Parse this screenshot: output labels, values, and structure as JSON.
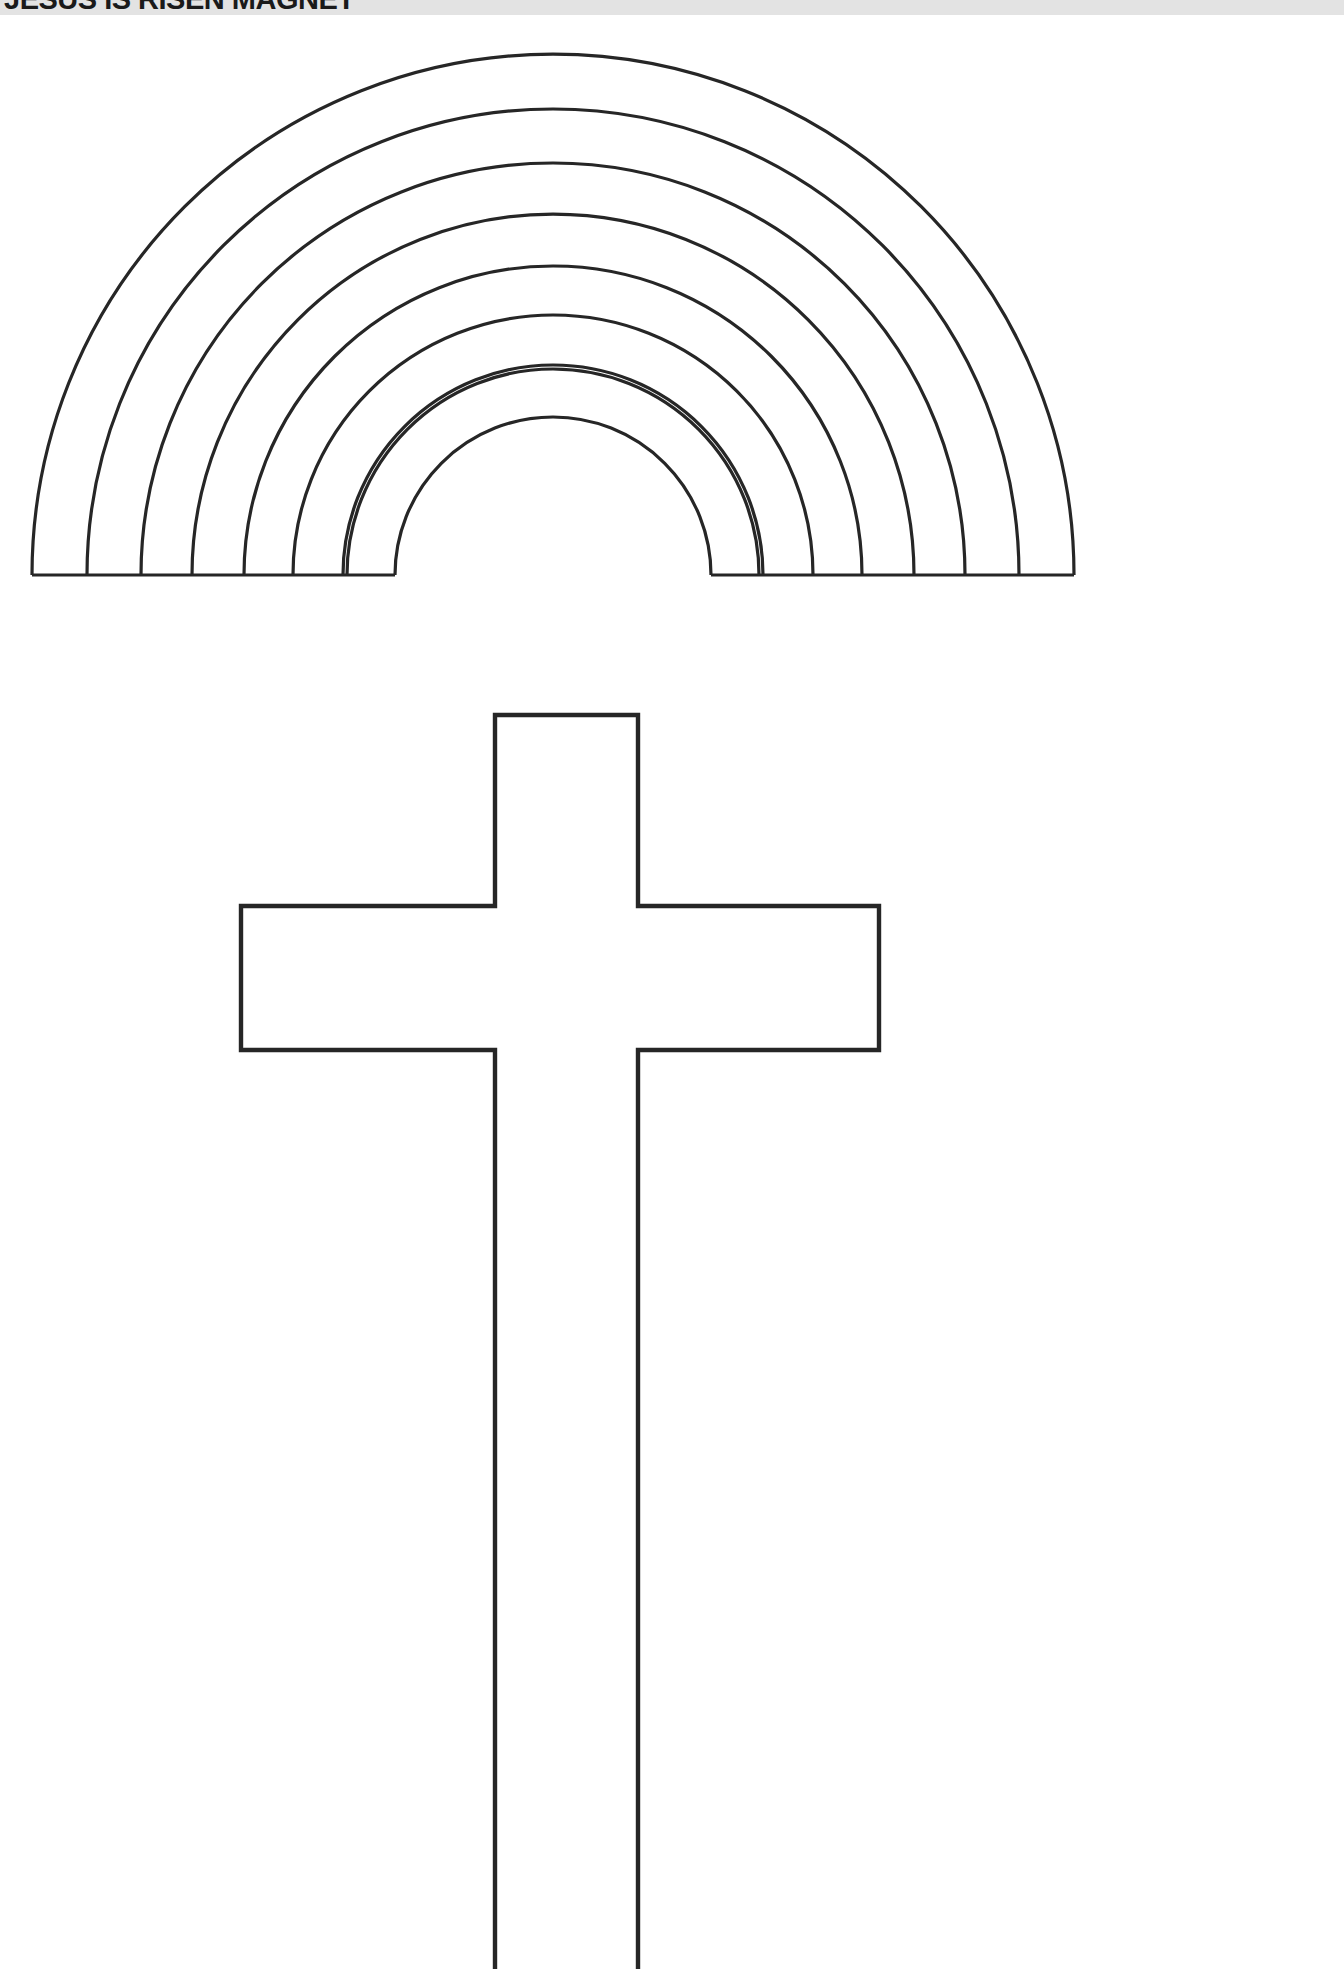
{
  "header": {
    "title": "JESUS IS RISEN MAGNET",
    "band_color": "#e3e3e3",
    "text_color": "#1a1a1a",
    "clipped": "true"
  },
  "page": {
    "background_color": "#ffffff",
    "ink_color": "#262626",
    "width": 1344,
    "height": 1969,
    "kind": "printable-craft-template",
    "shape_count": 2
  },
  "artwork": {
    "rainbow": {
      "name": "rainbow-outline",
      "description": "Nine concentric semicircular arch bands drawn as open outlines sitting on a horizontal baseline",
      "band_count": 9,
      "center_x": 553,
      "baseline_y": 575,
      "outer_radius": 521,
      "inner_radius": 158,
      "fill": "none",
      "stroke": "#262626"
    },
    "cross": {
      "name": "latin-cross-outline",
      "description": "Latin cross outline with vertical shaft running off the bottom edge of the page",
      "vertical_left_x": 495,
      "vertical_right_x": 638,
      "vertical_top_y": 715,
      "vertical_bottom_y": 1969,
      "arm_left_x": 241,
      "arm_right_x": 879,
      "arm_top_y": 906,
      "arm_bottom_y": 1050,
      "fill": "none",
      "stroke": "#262626"
    }
  }
}
